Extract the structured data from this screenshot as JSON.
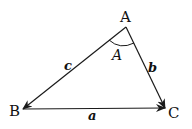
{
  "diagram": {
    "type": "triangle-vectors",
    "vertices": [
      {
        "id": "A",
        "label": "A"
      },
      {
        "id": "B",
        "label": "B"
      },
      {
        "id": "C",
        "label": "C"
      }
    ],
    "angle_label": "A",
    "sides": [
      {
        "id": "c",
        "label": "c",
        "from": "A",
        "to": "B"
      },
      {
        "id": "b",
        "label": "b",
        "from": "A",
        "to": "C"
      },
      {
        "id": "a",
        "label": "a",
        "from": "B",
        "to": "C"
      }
    ],
    "stroke_color": "#1a1a1a"
  }
}
